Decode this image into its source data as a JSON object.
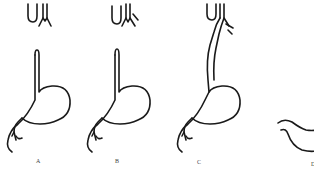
{
  "figure": {
    "panels": [
      {
        "id": "A",
        "label": "A"
      },
      {
        "id": "B",
        "label": "B"
      },
      {
        "id": "C",
        "label": "C"
      },
      {
        "id": "D",
        "label": "D"
      }
    ]
  },
  "colors": {
    "line": "#1a1a1a",
    "background": "#ffffff",
    "label": "#444444"
  }
}
